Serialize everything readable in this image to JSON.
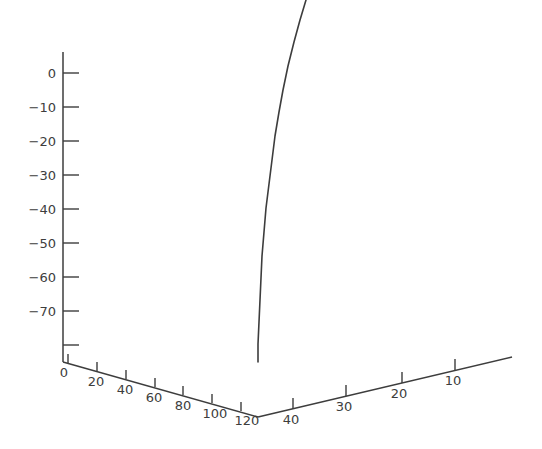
{
  "chart_data": {
    "type": "line",
    "projection": "3d-axes",
    "title": "",
    "background_color": "#ffffff",
    "line_color": "#3d3d3d",
    "axis_color": "#3d3d3d",
    "grid": false,
    "legend": null,
    "annotations": [],
    "axes": {
      "vertical": {
        "name": "z-axis",
        "xlabel": "",
        "ylabel": "",
        "tick_labels": [
          "0",
          "-10",
          "-20",
          "-30",
          "-40",
          "-50",
          "-60",
          "-70"
        ],
        "tick_values": [
          0,
          -10,
          -20,
          -30,
          -40,
          -50,
          -60,
          -70
        ],
        "range": [
          -80,
          0
        ],
        "unlabeled_ticks": [
          -80
        ],
        "tick_direction": "right",
        "label_side": "left"
      },
      "left": {
        "name": "x-axis",
        "xlabel": "",
        "tick_labels": [
          "0",
          "20",
          "40",
          "60",
          "80",
          "100",
          "120"
        ],
        "tick_values": [
          0,
          20,
          40,
          60,
          80,
          100,
          120
        ],
        "range": [
          0,
          140
        ],
        "direction": "increases-toward-origin-corner",
        "tick_direction": "up",
        "label_side": "below"
      },
      "right": {
        "name": "y-axis",
        "xlabel": "",
        "tick_labels": [
          "40",
          "30",
          "20",
          "10"
        ],
        "tick_values": [
          40,
          30,
          20,
          10
        ],
        "range": [
          5,
          40
        ],
        "direction": "decreases-away-from-origin-corner",
        "tick_direction": "up",
        "label_side": "below"
      }
    },
    "series": [
      {
        "name": "curve-1",
        "color": "#3d3d3d",
        "linewidth": 1.6,
        "points_px": [
          [
            306,
            0
          ],
          [
            300,
            20
          ],
          [
            294,
            42
          ],
          [
            288,
            66
          ],
          [
            283,
            90
          ],
          [
            279,
            112
          ],
          [
            275,
            136
          ],
          [
            272,
            160
          ],
          [
            269,
            184
          ],
          [
            266,
            208
          ],
          [
            264,
            232
          ],
          [
            262,
            256
          ],
          [
            261,
            278
          ],
          [
            260,
            300
          ],
          [
            259,
            322
          ],
          [
            258,
            344
          ],
          [
            258,
            362
          ]
        ],
        "description": "near-vertical trajectory curving outward toward the top"
      }
    ]
  },
  "geometry": {
    "origin_px": [
      258,
      362
    ],
    "vertical_axis_top_px": [
      63,
      52
    ],
    "vertical_axis_bottom_px": [
      63,
      362
    ],
    "left_axis_start_px": [
      63,
      362
    ],
    "right_axis_end_px": [
      512,
      357
    ],
    "vertical_tick_y_px": [
      73,
      107,
      141,
      175,
      209,
      243,
      277,
      311,
      345
    ],
    "left_axis_tick_x_px": [
      68,
      97,
      126,
      155,
      183,
      212,
      241
    ],
    "right_axis_tick_x_px": [
      293,
      346,
      402,
      455
    ]
  },
  "tick_text": {
    "vertical": [
      "0",
      "−10",
      "−20",
      "−30",
      "−40",
      "−50",
      "−60",
      "−70"
    ],
    "left": [
      "0",
      "20",
      "40",
      "60",
      "80",
      "100",
      "120"
    ],
    "right": [
      "40",
      "30",
      "20",
      "10"
    ]
  }
}
